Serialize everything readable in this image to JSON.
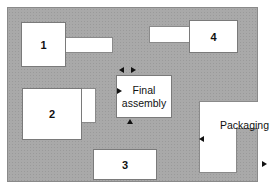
{
  "diagram": {
    "type": "facility-layout",
    "departments": [
      {
        "id": "1",
        "label": "1"
      },
      {
        "id": "2",
        "label": "2"
      },
      {
        "id": "3",
        "label": "3"
      },
      {
        "id": "4",
        "label": "4"
      },
      {
        "id": "final-assembly",
        "label_line1": "Final",
        "label_line2": "assembly"
      },
      {
        "id": "packaging",
        "label": "Packaging"
      }
    ],
    "arrows": [
      {
        "target": "final-assembly",
        "side": "top",
        "direction": "left"
      },
      {
        "target": "final-assembly",
        "side": "top",
        "direction": "right"
      },
      {
        "target": "final-assembly",
        "side": "left",
        "direction": "right"
      },
      {
        "target": "final-assembly",
        "side": "bottom",
        "direction": "up"
      },
      {
        "target": "packaging",
        "side": "left",
        "direction": "left"
      },
      {
        "target": "exit",
        "side": "right",
        "direction": "right"
      }
    ],
    "colors": {
      "floor": "#a9a9a9",
      "department": "#ffffff",
      "arrow": "#111111"
    }
  }
}
